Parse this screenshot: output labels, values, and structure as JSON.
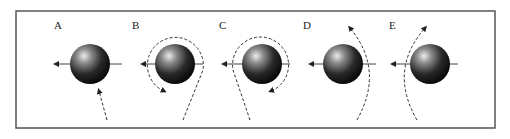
{
  "figure": {
    "frame_color": "#555555",
    "line_color": "#333333",
    "sphere_highlight": "#e8e8e8",
    "sphere_mid": "#5a5a5a",
    "sphere_dark": "#0a0a0a"
  },
  "panels": [
    {
      "label": "A",
      "description": "Dashed path approaches sphere from below, arrow toward sphere bottom"
    },
    {
      "label": "B",
      "description": "Dashed path rises on right and loops counter-clockwise around sphere"
    },
    {
      "label": "C",
      "description": "Dashed path rises on left and loops clockwise around sphere"
    },
    {
      "label": "D",
      "description": "Dashed path curves upward to the right of sphere"
    },
    {
      "label": "E",
      "description": "Dashed path curves upward to the left of sphere"
    }
  ]
}
